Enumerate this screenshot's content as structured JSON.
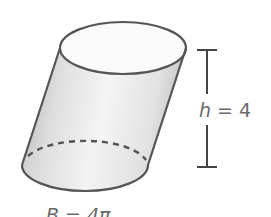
{
  "diagram": {
    "type": "oblique-cylinder",
    "colors": {
      "outline": "#555555",
      "side_dark": "#b8b8b8",
      "side_light": "#f4f4f4",
      "side_right": "#c9c9c9",
      "top_face": "#fafafa",
      "base_face": "#ececec",
      "label": "#6a6a6a",
      "measure_bar": "#444444"
    },
    "height_label": {
      "variable": "h",
      "equals": "=",
      "value": "4"
    },
    "base_label": {
      "variable": "B",
      "equals": "=",
      "value": "4π"
    }
  }
}
